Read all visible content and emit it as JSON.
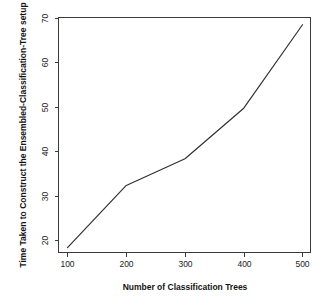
{
  "chart_data": {
    "type": "line",
    "title": "",
    "xlabel": "Number of Classification Trees",
    "ylabel": "Time Taken to Construct the Ensembled-Classification-Tree setup",
    "x": [
      100,
      200,
      300,
      400,
      500
    ],
    "values": [
      18.4,
      32.4,
      38.4,
      49.8,
      68.6
    ],
    "series": [
      {
        "name": "Time Taken",
        "values": [
          18.4,
          32.4,
          38.4,
          49.8,
          68.6
        ]
      }
    ],
    "xlim": [
      82,
      518
    ],
    "ylim": [
      17.5,
      70.6
    ],
    "xticks": [
      100,
      200,
      300,
      400,
      500
    ],
    "xtick_labels": [
      "100",
      "200",
      "300",
      "400",
      "500"
    ],
    "yticks": [
      20,
      30,
      40,
      50,
      60,
      70
    ],
    "ytick_labels": [
      "20",
      "30",
      "40",
      "50",
      "60",
      "70"
    ],
    "grid": false,
    "legend": false,
    "legend_position": "none",
    "line_color": "#2e2e2e",
    "axis_color": "#3a3a3a",
    "background_color": "#ffffff",
    "ylabel_rotation": 90,
    "ytick_label_rotation": 90
  },
  "axes": {
    "x_axis_title": "Number of Classification Trees",
    "y_axis_title": "Time Taken to Construct the Ensembled-Classification-Tree setup",
    "x_tick_labels": [
      "100",
      "200",
      "300",
      "400",
      "500"
    ],
    "y_tick_labels": [
      "70",
      "60",
      "50",
      "40",
      "30",
      "20"
    ]
  }
}
